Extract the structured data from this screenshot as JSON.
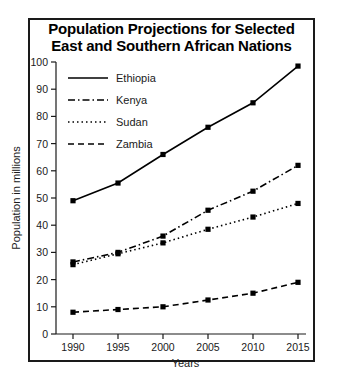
{
  "chart_data": {
    "type": "line",
    "title": "Population Projections for Selected East and Southern African Nations",
    "title_line1": "Population Projections for Selected",
    "title_line2": "East and Southern African Nations",
    "xlabel": "Years",
    "ylabel": "Population in millions",
    "x": [
      1990,
      1995,
      2000,
      2005,
      2010,
      2015
    ],
    "xtick_labels": [
      "1990",
      "1995",
      "2000",
      "2005",
      "2010",
      "2015"
    ],
    "ytick_labels": [
      "0",
      "10",
      "20",
      "30",
      "40",
      "50",
      "60",
      "70",
      "80",
      "90",
      "100"
    ],
    "ylim": [
      0,
      100
    ],
    "xlim": [
      1988,
      2017
    ],
    "grid": false,
    "legend_position": "top-left",
    "series": [
      {
        "name": "Ethiopia",
        "style": "solid",
        "color": "#000000",
        "values": [
          49,
          55.5,
          66,
          76,
          85,
          98.5
        ]
      },
      {
        "name": "Kenya",
        "style": "dash-dot",
        "color": "#000000",
        "values": [
          26.5,
          30,
          36,
          45.5,
          52.5,
          62
        ]
      },
      {
        "name": "Sudan",
        "style": "dotted",
        "color": "#000000",
        "values": [
          25.5,
          29.5,
          33.5,
          38.5,
          43,
          48
        ]
      },
      {
        "name": "Zambia",
        "style": "dashed",
        "color": "#000000",
        "values": [
          8,
          9,
          10,
          12.5,
          15,
          19
        ]
      }
    ]
  }
}
